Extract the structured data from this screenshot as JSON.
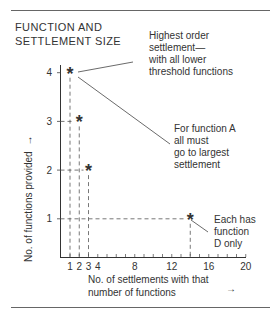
{
  "title": "FUNCTION AND\nSETTLEMENT SIZE",
  "annotations": {
    "highest_order": [
      "Highest order",
      "settlement—",
      "with all lower",
      "threshold functions"
    ],
    "function_a": [
      "For function A",
      "all must",
      "go to largest",
      "settlement"
    ],
    "function_d": [
      "Each has",
      "function",
      "D only"
    ]
  },
  "axes": {
    "y_label": "No. of functions provided",
    "y_arrow": "→",
    "x_label_line1": "No. of settlements with that",
    "x_label_line2": "number of functions",
    "x_arrow": "→"
  },
  "marker_glyph": "∗",
  "chart_data": {
    "type": "scatter",
    "title": "FUNCTION AND SETTLEMENT SIZE",
    "xlabel": "No. of settlements with that number of functions",
    "ylabel": "No. of functions provided",
    "x_ticks": [
      1,
      2,
      3,
      4,
      8,
      12,
      16,
      20
    ],
    "y_ticks": [
      1,
      2,
      3,
      4
    ],
    "xlim": [
      0,
      20
    ],
    "ylim": [
      0,
      4.5
    ],
    "points": [
      {
        "x": 1,
        "y": 4
      },
      {
        "x": 2,
        "y": 3
      },
      {
        "x": 3,
        "y": 2
      },
      {
        "x": 14,
        "y": 1
      }
    ],
    "grid": false,
    "dashed_guides": true
  }
}
